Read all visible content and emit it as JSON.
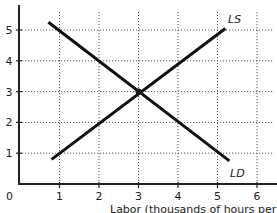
{
  "chart_data": {
    "type": "line",
    "title": "",
    "xlabel": "Labor (thousands of hours per day)",
    "ylabel": "",
    "xlim": [
      0,
      6.4
    ],
    "ylim": [
      0,
      5.6
    ],
    "x_ticks": [
      1,
      2,
      3,
      4,
      5,
      6
    ],
    "y_ticks": [
      1,
      2,
      3,
      4,
      5
    ],
    "origin_label": "0",
    "grid": true,
    "grid_style": "dotted",
    "legend": "none (curves labeled inline)",
    "series": [
      {
        "name": "LD",
        "label": "LD",
        "points": [
          [
            0.72,
            5.25
          ],
          [
            5.3,
            0.75
          ]
        ]
      },
      {
        "name": "LS",
        "label": "LS",
        "points": [
          [
            0.8,
            0.8
          ],
          [
            5.2,
            5.05
          ]
        ]
      }
    ],
    "annotations": [
      {
        "type": "point",
        "x": 3,
        "y": 3,
        "text": "equilibrium intersection"
      }
    ]
  },
  "labels": {
    "origin": "0",
    "x_ticks": [
      "1",
      "2",
      "3",
      "4",
      "5",
      "6"
    ],
    "y_ticks": [
      "1",
      "2",
      "3",
      "4",
      "5"
    ],
    "ld": "LD",
    "ls": "LS",
    "x_axis_title": "Labor (thousands of hours per day)"
  },
  "colors": {
    "line": "#111111",
    "grid": "#555555",
    "axis": "#222222"
  }
}
